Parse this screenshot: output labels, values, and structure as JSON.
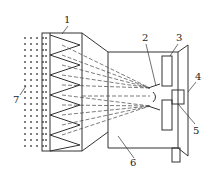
{
  "diagram": {
    "type": "technical-schematic",
    "labels": [
      {
        "id": "1",
        "text": "1",
        "x": 66,
        "y": 17
      },
      {
        "id": "2",
        "text": "2",
        "x": 144,
        "y": 35
      },
      {
        "id": "3",
        "text": "3",
        "x": 176,
        "y": 35
      },
      {
        "id": "4",
        "text": "4",
        "x": 195,
        "y": 73
      },
      {
        "id": "5",
        "text": "5",
        "x": 194,
        "y": 126
      },
      {
        "id": "6",
        "text": "6",
        "x": 132,
        "y": 160
      },
      {
        "id": "7",
        "text": "7",
        "x": 16,
        "y": 96
      }
    ],
    "colors": {
      "line": "#333333",
      "background": "#ffffff"
    }
  }
}
